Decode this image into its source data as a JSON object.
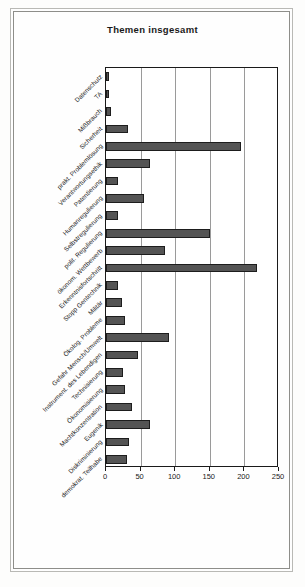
{
  "document": {
    "kind": "scanned-bar-chart-page"
  },
  "chart_data": {
    "type": "bar",
    "orientation": "horizontal",
    "title": "Themen insgesamt",
    "xlabel": "",
    "ylabel": "",
    "xlim": [
      0,
      250
    ],
    "xticks": [
      0,
      50,
      100,
      150,
      200,
      250
    ],
    "grid": true,
    "grid_axis": "x",
    "legend": false,
    "bar_color": "#545454",
    "bar_edge_color": "#1d1d1d",
    "categories": [
      "Datenschutz",
      "TA",
      "Mißbrauch",
      "Sicherheit",
      "prakt. Problemlösung",
      "Verantwortungsethik",
      "Patentierung",
      "Humanregulierung",
      "Selbstregulierung",
      "polit. Regulierung",
      "ökonom. Wettbewerb",
      "Erkenntnisfortschritt",
      "Stopp Gentechnik",
      "Militär",
      "Ökolog. Probleme",
      "Gefahr Mensch/Umwelt",
      "Instrument. des Lebendigen",
      "Technisierung",
      "Ökonomisierung",
      "Machtkonzentration",
      "Eugenik",
      "Diskriminierung",
      "demokrat. Teilhabe"
    ],
    "values": [
      5,
      5,
      7,
      32,
      195,
      63,
      18,
      55,
      17,
      150,
      85,
      218,
      17,
      23,
      27,
      91,
      46,
      24,
      28,
      38,
      63,
      33,
      31
    ]
  }
}
